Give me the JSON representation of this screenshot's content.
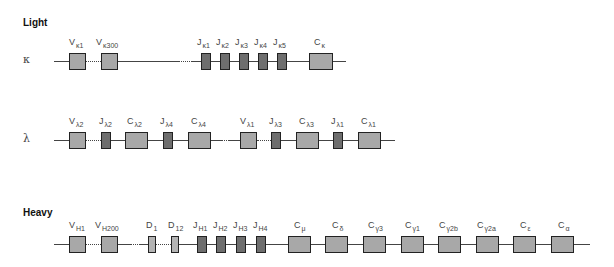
{
  "sections": {
    "light": "Light",
    "heavy": "Heavy"
  },
  "rows": {
    "kappa": {
      "label": "κ",
      "segments": [
        {
          "main": "V",
          "sub": "κ1"
        },
        {
          "main": "V",
          "sub": "κ300"
        },
        {
          "main": "J",
          "sub": "κ1"
        },
        {
          "main": "J",
          "sub": "κ2"
        },
        {
          "main": "J",
          "sub": "κ3"
        },
        {
          "main": "J",
          "sub": "κ4"
        },
        {
          "main": "J",
          "sub": "κ5"
        },
        {
          "main": "C",
          "sub": "κ"
        }
      ]
    },
    "lambda": {
      "label": "λ",
      "segments": [
        {
          "main": "V",
          "sub": "λ2"
        },
        {
          "main": "J",
          "sub": "λ2"
        },
        {
          "main": "C",
          "sub": "λ2"
        },
        {
          "main": "J",
          "sub": "λ4"
        },
        {
          "main": "C",
          "sub": "λ4"
        },
        {
          "main": "V",
          "sub": "λ1"
        },
        {
          "main": "J",
          "sub": "λ3"
        },
        {
          "main": "C",
          "sub": "λ3"
        },
        {
          "main": "J",
          "sub": "λ1"
        },
        {
          "main": "C",
          "sub": "λ1"
        }
      ]
    },
    "heavy": {
      "segments": [
        {
          "main": "V",
          "sub": "H1"
        },
        {
          "main": "V",
          "sub": "H200"
        },
        {
          "main": "D",
          "sub": "1"
        },
        {
          "main": "D",
          "sub": "12"
        },
        {
          "main": "J",
          "sub": "H1"
        },
        {
          "main": "J",
          "sub": "H2"
        },
        {
          "main": "J",
          "sub": "H3"
        },
        {
          "main": "J",
          "sub": "H4"
        },
        {
          "main": "C",
          "sub": "μ"
        },
        {
          "main": "C",
          "sub": "δ"
        },
        {
          "main": "C",
          "sub": "γ3"
        },
        {
          "main": "C",
          "sub": "γ1"
        },
        {
          "main": "C",
          "sub": "γ2b"
        },
        {
          "main": "C",
          "sub": "γ2a"
        },
        {
          "main": "C",
          "sub": "ε"
        },
        {
          "main": "C",
          "sub": "α"
        }
      ]
    }
  },
  "colors": {
    "v_segment": "#a8a8a8",
    "j_segment": "#6e6e6e",
    "c_segment": "#a8a8a8",
    "d_segment": "#b4b4b4",
    "line": "#444444"
  }
}
